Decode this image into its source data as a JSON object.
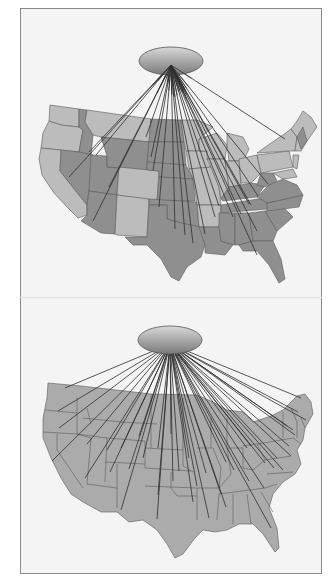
{
  "figure": {
    "background": "#f4f4f4",
    "frame_color": "#8a8a8a",
    "line_color": "#2e2e2e"
  },
  "panels": [
    {
      "id": "top",
      "description": "US flow map with shaded state groups; lines radiate from an elliptical hub to selected states",
      "hub": {
        "cx": 150,
        "cy": 52,
        "rx": 32,
        "ry": 14
      },
      "state_fill_light": "#bcbcbc",
      "state_fill_dark": "#8f8f8f",
      "endpoints": [
        [
          68,
          143
        ],
        [
          48,
          168
        ],
        [
          75,
          146
        ],
        [
          88,
          178
        ],
        [
          72,
          212
        ],
        [
          125,
          128
        ],
        [
          130,
          148
        ],
        [
          132,
          161
        ],
        [
          138,
          198
        ],
        [
          154,
          220
        ],
        [
          164,
          226
        ],
        [
          172,
          234
        ],
        [
          184,
          225
        ],
        [
          194,
          208
        ],
        [
          198,
          197
        ],
        [
          212,
          208
        ],
        [
          220,
          205
        ],
        [
          228,
          195
        ],
        [
          237,
          187
        ],
        [
          247,
          175
        ],
        [
          236,
          246
        ],
        [
          236,
          222
        ],
        [
          230,
          196
        ],
        [
          264,
          130
        ]
      ]
    },
    {
      "id": "bottom",
      "description": "US flow map with uniform state fill; many lines radiate from an elliptical hub to all states",
      "hub": {
        "cx": 149,
        "cy": 42,
        "rx": 32,
        "ry": 14
      },
      "state_fill": "#ababab",
      "endpoints": [
        [
          44,
          90
        ],
        [
          37,
          113
        ],
        [
          38,
          130
        ],
        [
          31,
          163
        ],
        [
          66,
          146
        ],
        [
          64,
          180
        ],
        [
          86,
          152
        ],
        [
          89,
          174
        ],
        [
          100,
          150
        ],
        [
          108,
          171
        ],
        [
          100,
          212
        ],
        [
          118,
          138
        ],
        [
          122,
          160
        ],
        [
          137,
          150
        ],
        [
          137,
          197
        ],
        [
          136,
          221
        ],
        [
          150,
          136
        ],
        [
          152,
          183
        ],
        [
          158,
          173
        ],
        [
          168,
          160
        ],
        [
          172,
          204
        ],
        [
          176,
          188
        ],
        [
          185,
          175
        ],
        [
          188,
          220
        ],
        [
          200,
          196
        ],
        [
          205,
          209
        ],
        [
          205,
          164
        ],
        [
          213,
          172
        ],
        [
          228,
          183
        ],
        [
          226,
          150
        ],
        [
          230,
          148
        ],
        [
          244,
          165
        ],
        [
          250,
          230
        ],
        [
          243,
          190
        ],
        [
          253,
          170
        ],
        [
          256,
          160
        ],
        [
          268,
          148
        ],
        [
          266,
          128
        ],
        [
          272,
          132
        ],
        [
          274,
          137
        ],
        [
          277,
          114
        ],
        [
          285,
          122
        ],
        [
          262,
          172
        ],
        [
          270,
          158
        ],
        [
          280,
          100
        ]
      ]
    }
  ]
}
